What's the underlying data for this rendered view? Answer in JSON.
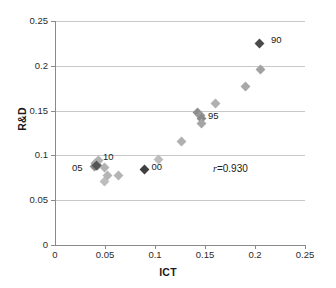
{
  "chart_data": {
    "type": "scatter",
    "title": "",
    "xlabel": "ICT",
    "ylabel": "R&D",
    "xlim": [
      0,
      0.25
    ],
    "ylim": [
      0,
      0.25
    ],
    "xticks": [
      "0",
      "0.05",
      "0.1",
      "0.15",
      "0.2",
      "0.25"
    ],
    "xtick_values": [
      0,
      0.05,
      0.1,
      0.15,
      0.2,
      0.25
    ],
    "yticks": [
      "0",
      "0.05",
      "0.1",
      "0.15",
      "0.2",
      "0.25"
    ],
    "ytick_values": [
      0,
      0.05,
      0.1,
      0.15,
      0.2,
      0.25
    ],
    "grid": "horizontal",
    "legend": "none",
    "marker": "diamond",
    "series": [
      {
        "name": "observations",
        "color": "#a6a6a6",
        "points": [
          {
            "x": 0.0395,
            "y": 0.0875,
            "color": "#8f8f8f"
          },
          {
            "x": 0.0405,
            "y": 0.0905,
            "color": "#9a9a9a"
          },
          {
            "x": 0.0415,
            "y": 0.0925,
            "color": "#a8a8a8"
          },
          {
            "x": 0.0425,
            "y": 0.0885,
            "color": "#9e9e9e"
          },
          {
            "x": 0.0435,
            "y": 0.0945,
            "color": "#b0b0b0"
          },
          {
            "x": 0.0495,
            "y": 0.0865,
            "color": "#b2b2b2"
          },
          {
            "x": 0.049,
            "y": 0.0705,
            "color": "#bdbdbd"
          },
          {
            "x": 0.052,
            "y": 0.0775,
            "color": "#b5b5b5"
          },
          {
            "x": 0.063,
            "y": 0.0775,
            "color": "#b5b5b5"
          },
          {
            "x": 0.103,
            "y": 0.0955,
            "color": "#bdbdbd"
          },
          {
            "x": 0.126,
            "y": 0.116,
            "color": "#b0b0b0"
          },
          {
            "x": 0.142,
            "y": 0.148,
            "color": "#8d8d8d"
          },
          {
            "x": 0.145,
            "y": 0.145,
            "color": "#9a9a9a"
          },
          {
            "x": 0.146,
            "y": 0.141,
            "color": "#8a8a8a"
          },
          {
            "x": 0.1465,
            "y": 0.1355,
            "color": "#a5a5a5"
          },
          {
            "x": 0.16,
            "y": 0.158,
            "color": "#b0b0b0"
          },
          {
            "x": 0.19,
            "y": 0.177,
            "color": "#a8a8a8"
          },
          {
            "x": 0.205,
            "y": 0.196,
            "color": "#a2a2a2"
          }
        ]
      },
      {
        "name": "highlighted-years",
        "color": "#4d4d4d",
        "points": [
          {
            "x": 0.2045,
            "y": 0.225,
            "color": "#4a4a4a",
            "label": "90",
            "label_dx": 7,
            "label_dy": -5
          },
          {
            "x": 0.089,
            "y": 0.084,
            "color": "#3f3f3f",
            "label": "00",
            "label_dx": 7,
            "label_dy": -5
          },
          {
            "x": 0.041,
            "y": 0.089,
            "color": "#555555",
            "label": "05",
            "label_dx": -22,
            "label_dy": -2
          }
        ]
      }
    ],
    "point_labels": [
      {
        "text": "90",
        "x": 0.216,
        "y": 0.229
      },
      {
        "text": "95",
        "x": 0.153,
        "y": 0.144
      },
      {
        "text": "10",
        "x": 0.048,
        "y": 0.0985
      },
      {
        "text": "05",
        "x": 0.017,
        "y": 0.0855
      },
      {
        "text": "00",
        "x": 0.0965,
        "y": 0.087
      }
    ],
    "annotations": [
      {
        "name": "correlation",
        "symbol": "r",
        "operator": "=",
        "value": "0.930",
        "x": 0.158,
        "y": 0.0845
      }
    ]
  },
  "colors": {
    "axis": "#8a8a8a",
    "grid": "#c8c8c8",
    "text": "#1a1a1a",
    "marker_light": "#a6a6a6",
    "marker_dark": "#4a4a4a",
    "background": "#ffffff"
  }
}
